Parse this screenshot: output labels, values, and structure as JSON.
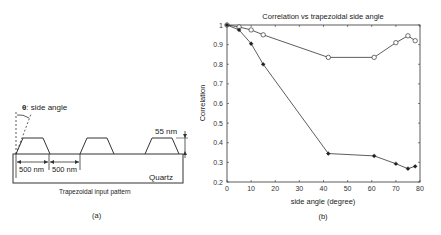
{
  "panel_a": {
    "angle_label_symbol": "θ",
    "angle_label_text": ": side angle",
    "height_label": "55 nm",
    "pitch_label_1": "500 nm",
    "pitch_label_2": "500 nm",
    "substrate_label": "Quartz",
    "caption": "Trapezoidal input pattern",
    "panel_label": "(a)"
  },
  "panel_b": {
    "panel_label": "(b)"
  },
  "chart_data": {
    "type": "line",
    "title": "Correlation vs trapezoidal side angle",
    "xlabel": "side angle (degree)",
    "ylabel": "Correlation",
    "xlim": [
      0,
      80
    ],
    "ylim": [
      0.2,
      1.0
    ],
    "xticks": [
      0,
      10,
      20,
      30,
      40,
      50,
      60,
      70,
      80
    ],
    "yticks": [
      0.2,
      0.3,
      0.4,
      0.5,
      0.6,
      0.7,
      0.8,
      0.9,
      1
    ],
    "ytick_labels": [
      "0.2",
      "0.3",
      "0.4",
      "0.5",
      "0.6",
      "0.7",
      "0.8",
      "0.9",
      "1"
    ],
    "grid": false,
    "legend": null,
    "series": [
      {
        "name": "circle-marker series",
        "marker": "o",
        "x": [
          0,
          5,
          10,
          15,
          42,
          61,
          70,
          75,
          78
        ],
        "values": [
          1.0,
          0.99,
          0.975,
          0.95,
          0.835,
          0.835,
          0.91,
          0.945,
          0.92
        ]
      },
      {
        "name": "star-marker series",
        "marker": "*",
        "x": [
          0,
          5,
          10,
          15,
          42,
          61,
          70,
          75,
          78
        ],
        "values": [
          1.0,
          0.975,
          0.905,
          0.8,
          0.345,
          0.333,
          0.293,
          0.268,
          0.28
        ]
      }
    ]
  }
}
